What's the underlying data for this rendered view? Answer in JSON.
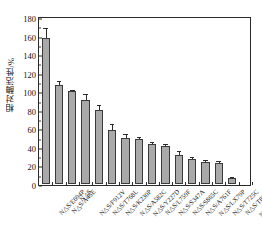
{
  "chart_data": {
    "type": "bar",
    "title": "",
    "xlabel": "",
    "ylabel": "相对酶活性/%",
    "ylim": [
      0,
      180
    ],
    "ytick_labels": [
      "0",
      "20",
      "40",
      "60",
      "80",
      "100",
      "120",
      "140",
      "160",
      "180"
    ],
    "ytick_values": [
      0,
      20,
      40,
      60,
      80,
      100,
      120,
      140,
      160,
      180
    ],
    "grid": false,
    "legend": null,
    "bar_color": "#a9a9a9",
    "bar_edge_color": "#3a3a3a",
    "categories": [
      "N△S/E694P",
      "N△S/A45E",
      "N△S",
      "N△S/F912V",
      "N△S/T768L",
      "N△S/K230P",
      "N△S/A582C",
      "N△S/Y227D",
      "N△S/L759F",
      "N△S/S347A",
      "N△S/S865C",
      "N△S/A761F",
      "N△S/LX79P",
      "N△S/T725C",
      "N△S/T830P",
      "N△S/W635R"
    ],
    "values": [
      157,
      106.5,
      100,
      91,
      80,
      58.5,
      50,
      48,
      43,
      41.5,
      31.5,
      26.5,
      24,
      23,
      6,
      0
    ],
    "errors": [
      10,
      3.5,
      0.5,
      5,
      4.5,
      5,
      3,
      2,
      1.5,
      1,
      2.5,
      2,
      1,
      1,
      1,
      0
    ]
  }
}
